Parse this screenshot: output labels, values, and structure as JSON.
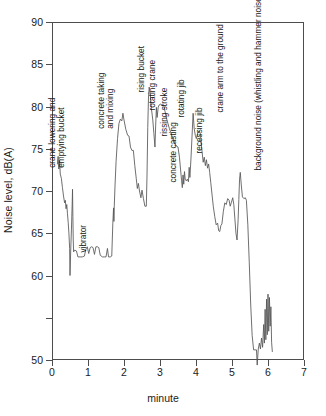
{
  "chart_data": {
    "type": "line",
    "title": "",
    "xlabel": "minute",
    "ylabel": "Noise level, dB(A)",
    "xlim": [
      0,
      7
    ],
    "ylim": [
      50,
      90
    ],
    "xticks": [
      0,
      1,
      2,
      3,
      4,
      5,
      6,
      7
    ],
    "yticks": [
      50,
      55,
      60,
      65,
      70,
      75,
      80,
      85,
      90
    ],
    "ytick_labels": [
      "50",
      "",
      "60",
      "65",
      "70",
      "75",
      "80",
      "85",
      "90"
    ],
    "grid": false,
    "legend": "none",
    "series_name": "noise level",
    "line_color": "#555555",
    "points": [
      [
        0.15,
        73.2
      ],
      [
        0.17,
        74.1
      ],
      [
        0.19,
        72.6
      ],
      [
        0.21,
        73.6
      ],
      [
        0.23,
        72.0
      ],
      [
        0.26,
        71.5
      ],
      [
        0.29,
        70.4
      ],
      [
        0.32,
        69.4
      ],
      [
        0.35,
        68.6
      ],
      [
        0.37,
        68.9
      ],
      [
        0.39,
        67.9
      ],
      [
        0.41,
        68.4
      ],
      [
        0.43,
        67.3
      ],
      [
        0.45,
        66.3
      ],
      [
        0.47,
        65.0
      ],
      [
        0.49,
        63.2
      ],
      [
        0.5,
        60.0
      ],
      [
        0.52,
        63.0
      ],
      [
        0.54,
        65.5
      ],
      [
        0.56,
        68.4
      ],
      [
        0.57,
        70.2
      ],
      [
        0.58,
        67.0
      ],
      [
        0.59,
        64.2
      ],
      [
        0.6,
        62.8
      ],
      [
        0.63,
        63.0
      ],
      [
        0.68,
        62.9
      ],
      [
        0.72,
        62.2
      ],
      [
        0.78,
        62.2
      ],
      [
        0.84,
        62.2
      ],
      [
        0.9,
        62.3
      ],
      [
        0.94,
        63.1
      ],
      [
        0.98,
        63.4
      ],
      [
        1.02,
        62.6
      ],
      [
        1.06,
        63.3
      ],
      [
        1.1,
        63.4
      ],
      [
        1.14,
        63.3
      ],
      [
        1.18,
        62.5
      ],
      [
        1.22,
        63.4
      ],
      [
        1.26,
        63.4
      ],
      [
        1.3,
        63.3
      ],
      [
        1.34,
        62.4
      ],
      [
        1.4,
        62.2
      ],
      [
        1.46,
        62.2
      ],
      [
        1.5,
        62.2
      ],
      [
        1.54,
        63.2
      ],
      [
        1.57,
        62.2
      ],
      [
        1.62,
        62.2
      ],
      [
        1.66,
        62.3
      ],
      [
        1.69,
        66.2
      ],
      [
        1.71,
        68.0
      ],
      [
        1.72,
        66.4
      ],
      [
        1.73,
        68.2
      ],
      [
        1.75,
        70.6
      ],
      [
        1.78,
        73.5
      ],
      [
        1.82,
        76.2
      ],
      [
        1.86,
        78.0
      ],
      [
        1.9,
        78.5
      ],
      [
        1.94,
        78.3
      ],
      [
        1.97,
        79.2
      ],
      [
        2.0,
        78.4
      ],
      [
        2.05,
        77.3
      ],
      [
        2.1,
        76.6
      ],
      [
        2.14,
        76.5
      ],
      [
        2.18,
        75.2
      ],
      [
        2.22,
        74.8
      ],
      [
        2.26,
        74.8
      ],
      [
        2.3,
        73.0
      ],
      [
        2.34,
        71.5
      ],
      [
        2.37,
        70.3
      ],
      [
        2.4,
        70.9
      ],
      [
        2.43,
        70.0
      ],
      [
        2.47,
        69.2
      ],
      [
        2.5,
        70.1
      ],
      [
        2.54,
        69.1
      ],
      [
        2.58,
        68.2
      ],
      [
        2.62,
        68.2
      ],
      [
        2.64,
        72.0
      ],
      [
        2.66,
        77.5
      ],
      [
        2.68,
        81.0
      ],
      [
        2.7,
        82.3
      ],
      [
        2.73,
        81.4
      ],
      [
        2.76,
        79.8
      ],
      [
        2.8,
        78.4
      ],
      [
        2.83,
        76.8
      ],
      [
        2.86,
        75.2
      ],
      [
        2.88,
        77.8
      ],
      [
        2.9,
        79.9
      ],
      [
        2.92,
        78.7
      ],
      [
        2.95,
        79.9
      ],
      [
        2.98,
        80.2
      ],
      [
        3.02,
        80.3
      ],
      [
        3.06,
        80.1
      ],
      [
        3.1,
        80.2
      ],
      [
        3.14,
        79.4
      ],
      [
        3.18,
        78.6
      ],
      [
        3.22,
        78.0
      ],
      [
        3.26,
        77.4
      ],
      [
        3.3,
        76.9
      ],
      [
        3.34,
        76.4
      ],
      [
        3.38,
        76.0
      ],
      [
        3.42,
        75.6
      ],
      [
        3.46,
        75.3
      ],
      [
        3.5,
        75.2
      ],
      [
        3.54,
        74.0
      ],
      [
        3.57,
        72.6
      ],
      [
        3.6,
        71.2
      ],
      [
        3.62,
        70.4
      ],
      [
        3.64,
        71.9
      ],
      [
        3.66,
        70.8
      ],
      [
        3.68,
        72.3
      ],
      [
        3.7,
        71.4
      ],
      [
        3.73,
        71.2
      ],
      [
        3.76,
        71.4
      ],
      [
        3.79,
        71.1
      ],
      [
        3.81,
        72.8
      ],
      [
        3.83,
        71.6
      ],
      [
        3.86,
        73.8
      ],
      [
        3.89,
        76.5
      ],
      [
        3.92,
        79.2
      ],
      [
        3.95,
        77.4
      ],
      [
        3.98,
        76.6
      ],
      [
        4.01,
        76.2
      ],
      [
        4.05,
        76.9
      ],
      [
        4.08,
        77.1
      ],
      [
        4.12,
        76.8
      ],
      [
        4.16,
        75.0
      ],
      [
        4.2,
        73.4
      ],
      [
        4.23,
        74.0
      ],
      [
        4.26,
        73.0
      ],
      [
        4.29,
        73.7
      ],
      [
        4.32,
        72.7
      ],
      [
        4.35,
        73.2
      ],
      [
        4.38,
        72.2
      ],
      [
        4.41,
        71.0
      ],
      [
        4.45,
        69.4
      ],
      [
        4.48,
        68.2
      ],
      [
        4.52,
        67.0
      ],
      [
        4.56,
        66.0
      ],
      [
        4.6,
        66.2
      ],
      [
        4.63,
        65.3
      ],
      [
        4.66,
        65.2
      ],
      [
        4.69,
        65.9
      ],
      [
        4.72,
        66.1
      ],
      [
        4.76,
        67.6
      ],
      [
        4.8,
        68.6
      ],
      [
        4.84,
        68.4
      ],
      [
        4.88,
        69.1
      ],
      [
        4.92,
        68.9
      ],
      [
        4.95,
        68.2
      ],
      [
        4.98,
        68.6
      ],
      [
        5.02,
        69.2
      ],
      [
        5.05,
        68.4
      ],
      [
        5.08,
        66.7
      ],
      [
        5.11,
        65.0
      ],
      [
        5.14,
        64.2
      ],
      [
        5.17,
        66.6
      ],
      [
        5.19,
        69.0
      ],
      [
        5.21,
        71.4
      ],
      [
        5.23,
        72.2
      ],
      [
        5.26,
        70.6
      ],
      [
        5.29,
        69.3
      ],
      [
        5.33,
        69.1
      ],
      [
        5.37,
        69.2
      ],
      [
        5.4,
        68.9
      ],
      [
        5.44,
        66.0
      ],
      [
        5.48,
        61.5
      ],
      [
        5.52,
        56.5
      ],
      [
        5.56,
        52.9
      ],
      [
        5.6,
        51.2
      ],
      [
        5.64,
        51.2
      ],
      [
        5.68,
        51.2
      ],
      [
        5.7,
        49.4
      ],
      [
        5.73,
        51.3
      ],
      [
        5.76,
        52.0
      ],
      [
        5.79,
        51.3
      ],
      [
        5.82,
        52.6
      ],
      [
        5.85,
        51.5
      ],
      [
        5.88,
        54.2
      ],
      [
        5.9,
        52.0
      ],
      [
        5.92,
        56.0
      ],
      [
        5.94,
        52.4
      ],
      [
        5.96,
        57.2
      ],
      [
        5.98,
        53.0
      ],
      [
        6.0,
        57.8
      ],
      [
        6.02,
        53.4
      ],
      [
        6.04,
        57.4
      ],
      [
        6.06,
        54.0
      ],
      [
        6.08,
        56.3
      ],
      [
        6.1,
        52.1
      ],
      [
        6.12,
        51.0
      ]
    ],
    "annotations": [
      {
        "id": "crane-lowering",
        "text": "crane lowering and",
        "text2": "emptying bucket",
        "x": 0.42,
        "y": 75.0
      },
      {
        "id": "vibrator",
        "text": "vibrator",
        "text2": "",
        "x": 1.02,
        "y": 63.8
      },
      {
        "id": "concrete-taking",
        "text": "concrete taking",
        "text2": "and mixing",
        "x": 1.77,
        "y": 79.6
      },
      {
        "id": "rising-bucket",
        "text": "rising bucket",
        "text2": "",
        "x": 2.64,
        "y": 82.8
      },
      {
        "id": "rotating-crane",
        "text": "rotating crane",
        "text2": "",
        "x": 2.93,
        "y": 80.6
      },
      {
        "id": "rissing-stroke",
        "text": "rissing stroke",
        "text2": "",
        "x": 3.29,
        "y": 77.6
      },
      {
        "id": "concrete-casting",
        "text": "concrete casting",
        "text2": "",
        "x": 3.54,
        "y": 72.1
      },
      {
        "id": "rotating-jib",
        "text": "rotating jib",
        "text2": "",
        "x": 3.76,
        "y": 79.8
      },
      {
        "id": "recessing-jib",
        "text": "recessing jib",
        "text2": "",
        "x": 4.24,
        "y": 75.6
      },
      {
        "id": "crane-arm",
        "text": "crane arm to the ground",
        "text2": "",
        "x": 4.82,
        "y": 80.4
      },
      {
        "id": "background-noise",
        "text": "background noise (whistling and hammer noise)",
        "text2": "",
        "x": 5.9,
        "y": 73.5
      }
    ]
  }
}
